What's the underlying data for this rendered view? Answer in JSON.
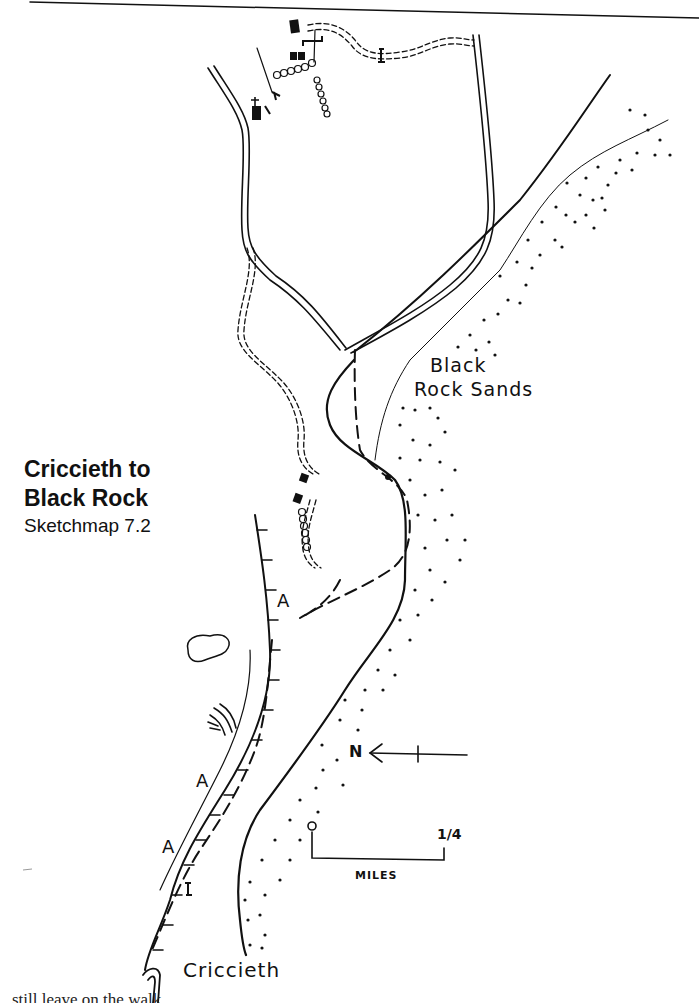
{
  "map": {
    "title_line1": "Criccieth to",
    "title_line2": "Black Rock",
    "subtitle": "Sketchmap 7.2",
    "labels": {
      "sands_line1": "Black",
      "sands_line2": "Rock Sands",
      "town": "Criccieth",
      "access_points": [
        "A",
        "A",
        "A"
      ]
    },
    "north_arrow": {
      "label": "N",
      "icon": "north-arrow-icon"
    },
    "scale_bar": {
      "start": "0",
      "end": "1/4",
      "unit": "MILES"
    },
    "legend_icons": [
      "church-icon",
      "building-icon",
      "stile-icon",
      "gate-icon",
      "hedge-icon",
      "railway-icon",
      "cliff-icon",
      "pond-icon",
      "sand-dots-icon"
    ],
    "colors": {
      "ink": "#111111",
      "paper": "#ffffff"
    }
  },
  "footer": {
    "text": "still leave on the walk..."
  }
}
